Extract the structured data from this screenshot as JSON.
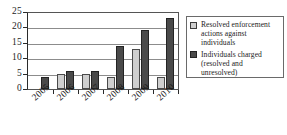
{
  "chart_data": {
    "type": "bar",
    "title": "",
    "subtitle": "",
    "xlabel": "",
    "ylabel": "",
    "categories": [
      "2005",
      "2006",
      "2007",
      "2008",
      "2009",
      "2010"
    ],
    "series": [
      {
        "name": "Resolved enforcement actions against individuals",
        "color": "#cfcfcf",
        "values": [
          0,
          5,
          5,
          4,
          13,
          4
        ]
      },
      {
        "name": "Individuals charged (resolved and unresolved)",
        "color": "#4a4a4a",
        "values": [
          4,
          6,
          6,
          14,
          19,
          23
        ]
      }
    ],
    "ylim": [
      0,
      25
    ],
    "yticks": [
      0,
      5,
      10,
      15,
      20,
      25
    ],
    "grid": true,
    "legend_position": "right"
  },
  "axes": {
    "y_tick_labels": [
      "25",
      "20",
      "15",
      "10",
      "5",
      "0"
    ],
    "x_tick_labels": [
      "2005",
      "2006",
      "2007",
      "2008",
      "2009",
      "2010"
    ]
  },
  "legend": {
    "entries": [
      {
        "label": "Resolved enforcement actions against individuals",
        "swatch": "light-gray-swatch"
      },
      {
        "label": "Individuals charged (resolved and unresolved)",
        "swatch": "dark-gray-swatch"
      }
    ]
  },
  "colors": {
    "series_light": "#cfcfcf",
    "series_dark": "#4a4a4a",
    "gridline": "#8c8c8c",
    "axis": "#2a2a2a",
    "background": "#ffffff"
  }
}
